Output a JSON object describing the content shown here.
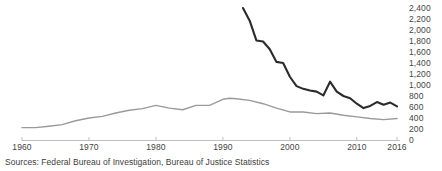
{
  "chart_data": {
    "type": "line",
    "title": "",
    "subtitle": "",
    "xlabel": "",
    "ylabel": "",
    "xlim": [
      1960,
      2016
    ],
    "ylim": [
      0,
      2400
    ],
    "grid": false,
    "legend_position": "none",
    "x_tick_labels": [
      "1960",
      "1970",
      "1980",
      "1990",
      "2000",
      "2010",
      "2016"
    ],
    "x_ticks": [
      1960,
      1970,
      1980,
      1990,
      2000,
      2010,
      2016
    ],
    "y_tick_labels": [
      "2,400",
      "2,200",
      "2,000",
      "1,800",
      "1,600",
      "1,400",
      "1,200",
      "1,000",
      "800",
      "600",
      "400",
      "200",
      "0"
    ],
    "y_ticks": [
      2400,
      2200,
      2000,
      1800,
      1600,
      1400,
      1200,
      1000,
      800,
      600,
      400,
      200,
      0
    ],
    "series": [
      {
        "name": "dark-line",
        "color": "#2b2b2b",
        "x": [
          1993,
          1994,
          1995,
          1996,
          1997,
          1998,
          1999,
          2000,
          2001,
          2002,
          2003,
          2004,
          2005,
          2006,
          2007,
          2008,
          2009,
          2010,
          2011,
          2012,
          2013,
          2014,
          2015,
          2016
        ],
        "values": [
          2400,
          2170,
          1810,
          1790,
          1650,
          1420,
          1400,
          1150,
          980,
          930,
          900,
          880,
          810,
          1060,
          880,
          800,
          760,
          660,
          580,
          620,
          690,
          640,
          680,
          610
        ]
      },
      {
        "name": "gray-line",
        "color": "#9a9a9a",
        "x": [
          1960,
          1962,
          1964,
          1966,
          1968,
          1970,
          1972,
          1974,
          1976,
          1978,
          1980,
          1982,
          1984,
          1986,
          1988,
          1990,
          1991,
          1992,
          1994,
          1996,
          1998,
          2000,
          2002,
          2004,
          2006,
          2008,
          2010,
          2012,
          2014,
          2016
        ],
        "values": [
          225,
          225,
          250,
          280,
          350,
          400,
          430,
          490,
          540,
          570,
          630,
          580,
          550,
          630,
          630,
          740,
          758,
          750,
          720,
          660,
          580,
          510,
          510,
          480,
          490,
          450,
          420,
          390,
          370,
          390
        ]
      }
    ],
    "annotations": []
  },
  "footer": {
    "source_text": "Sources: Federal Bureau of Investigation, Bureau of Justice Statistics"
  },
  "axis": {
    "baseline_color": "#bfbfbf",
    "tick_color": "#bfbfbf"
  }
}
